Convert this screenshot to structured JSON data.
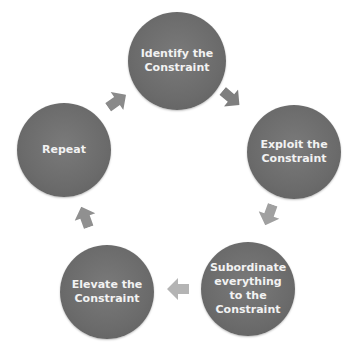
{
  "diagram": {
    "type": "cycle",
    "colors": {
      "node": "#6b6b6b",
      "node_text": "#f2f2f2",
      "arrow": "#8a8a8a",
      "background": "#ffffff"
    },
    "nodes": [
      {
        "id": "identify",
        "label": "Identify the Constraint"
      },
      {
        "id": "exploit",
        "label": "Exploit the Constraint"
      },
      {
        "id": "subordinate",
        "label": "Subordinate everything to the Constraint"
      },
      {
        "id": "elevate",
        "label": "Elevate the Constraint"
      },
      {
        "id": "repeat",
        "label": "Repeat"
      }
    ],
    "edges": [
      {
        "from": "identify",
        "to": "exploit"
      },
      {
        "from": "exploit",
        "to": "subordinate"
      },
      {
        "from": "subordinate",
        "to": "elevate"
      },
      {
        "from": "elevate",
        "to": "repeat"
      },
      {
        "from": "repeat",
        "to": "identify"
      }
    ]
  }
}
